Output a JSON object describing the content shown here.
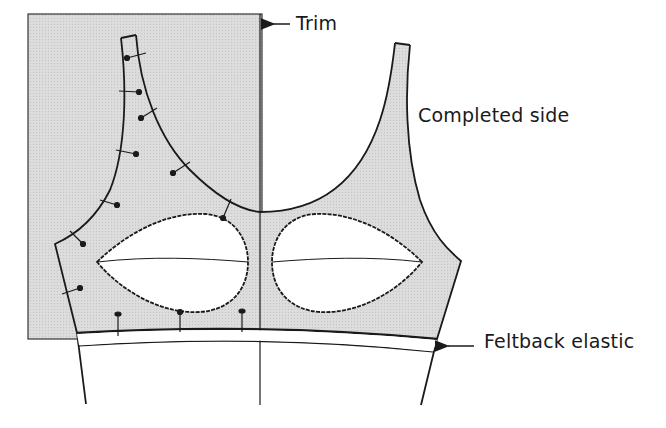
{
  "diagram": {
    "title": "",
    "colors": {
      "fabric_fill": "#d9d9d9",
      "line": "#1a1a1a",
      "background": "#ffffff"
    },
    "labels": {
      "trim": "Trim",
      "completed_side": "Completed side",
      "feltback_elastic": "Feltback elastic"
    },
    "callouts": [
      {
        "name": "trim",
        "arrow": "left-arrow",
        "points_to": "shaded trim rectangle"
      },
      {
        "name": "feltback_elastic",
        "arrow": "left-arrow",
        "points_to": "elastic band at bottom edge"
      }
    ],
    "elements": [
      "trim-rectangle",
      "left-strap",
      "right-strap",
      "neckline",
      "center-front-line",
      "left-cup-opening",
      "right-cup-opening",
      "elastic-band",
      "pins"
    ]
  }
}
